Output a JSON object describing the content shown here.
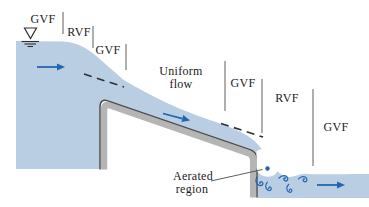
{
  "figure": {
    "labels": {
      "gvf_1": "GVF",
      "rvf_1": "RVF",
      "gvf_2": "GVF",
      "uniform_1": "Uniform",
      "uniform_2": "flow",
      "gvf_3": "GVF",
      "rvf_2": "RVF",
      "gvf_4": "GVF",
      "aerated_1": "Aerated",
      "aerated_2": "region"
    },
    "icons": [
      "water-surface-marker-icon",
      "flow-arrow-icon",
      "swirl-icon",
      "air-bubble-dot-icon"
    ]
  },
  "colors": {
    "water": "#b9cee3",
    "structure": "#b5b5b5",
    "outline": "#4a4a4a",
    "accent_blue": "#2166ae",
    "text": "#1c1c1c"
  }
}
